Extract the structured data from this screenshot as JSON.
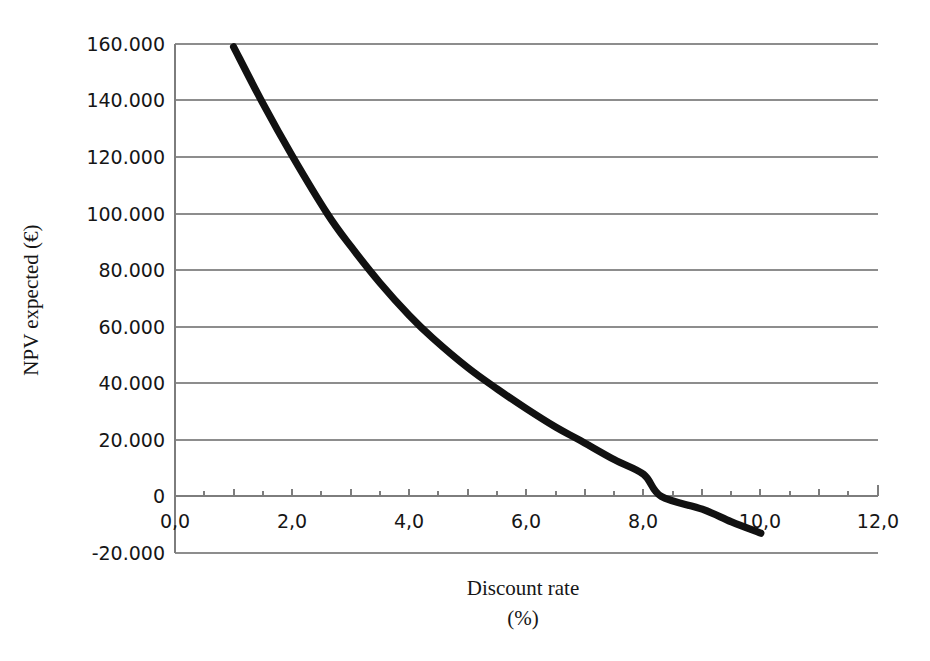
{
  "chart_data": {
    "type": "line",
    "title": "",
    "subtitle": "",
    "xlabel": "Discount rate",
    "xlabel_unit": "(%)",
    "ylabel": "NPV expected",
    "ylabel_unit": "(€)",
    "ylabel_full": "NPV expected  (€)",
    "xlim": [
      0.0,
      12.0
    ],
    "ylim": [
      -20000,
      160000
    ],
    "grid": "horizontal",
    "legend": "none",
    "x_tick_labels": [
      "0,0",
      "2,0",
      "4,0",
      "6,0",
      "8,0",
      "10,0",
      "12,0"
    ],
    "x_tick_values": [
      0.0,
      2.0,
      4.0,
      6.0,
      8.0,
      10.0,
      12.0
    ],
    "x_minor_tick_step": 0.5,
    "y_tick_labels": [
      "160.000",
      "140.000",
      "120.000",
      "100.000",
      "80.000",
      "60.000",
      "40.000",
      "20.000",
      "0",
      "-20.000"
    ],
    "y_tick_values": [
      160000,
      140000,
      120000,
      100000,
      80000,
      60000,
      40000,
      20000,
      0,
      -20000
    ],
    "series": [
      {
        "name": "NPV expected",
        "color": "#111111",
        "x": [
          1.0,
          1.5,
          2.0,
          2.6,
          3.0,
          3.5,
          4.0,
          4.4,
          5.0,
          5.5,
          6.0,
          6.5,
          6.9,
          7.5,
          8.0,
          8.3,
          9.0,
          9.5,
          10.0
        ],
        "y": [
          159000,
          139000,
          120500,
          100000,
          88500,
          75500,
          64000,
          56000,
          45500,
          38000,
          31000,
          24500,
          20000,
          13000,
          7800,
          0,
          -4500,
          -9000,
          -13000
        ]
      }
    ]
  }
}
